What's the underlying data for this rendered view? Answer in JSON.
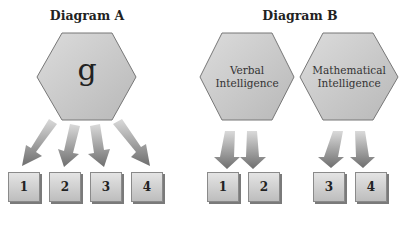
{
  "diagram_a": {
    "title": "Diagram A",
    "hexagon": {
      "label": "g"
    },
    "boxes": [
      "1",
      "2",
      "3",
      "4"
    ]
  },
  "diagram_b": {
    "title": "Diagram B",
    "hexagons": [
      {
        "label_line1": "Verbal",
        "label_line2": "Intelligence",
        "boxes": [
          "1",
          "2"
        ]
      },
      {
        "label_line1": "Mathematical",
        "label_line2": "Intelligence",
        "boxes": [
          "3",
          "4"
        ]
      }
    ]
  },
  "colors": {
    "hex_fill": "#c8c8c8",
    "hex_stroke": "#777777",
    "arrow": "#8a8a8a",
    "box": "#cfcfcf"
  }
}
